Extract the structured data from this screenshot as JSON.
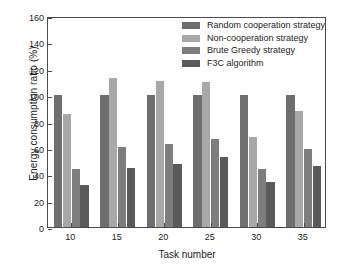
{
  "chart_data": {
    "type": "bar",
    "title": "",
    "xlabel": "Task number",
    "ylabel": "Energy consumption ratio (%)",
    "categories": [
      "10",
      "15",
      "20",
      "25",
      "30",
      "35"
    ],
    "ylim": [
      0,
      160
    ],
    "yticks": [
      0,
      20,
      40,
      60,
      80,
      100,
      120,
      140,
      160
    ],
    "grid": false,
    "legend_position": "top-right",
    "series": [
      {
        "name": "Random cooperation strategy",
        "color": "#6e6e6e",
        "values": [
          100,
          100,
          100,
          100,
          100,
          100
        ]
      },
      {
        "name": "Non-cooperation strategy",
        "color": "#a8a8a8",
        "values": [
          86,
          113,
          111,
          110,
          68,
          88
        ]
      },
      {
        "name": "Brute Greedy strategy",
        "color": "#7d7d7d",
        "values": [
          44,
          61,
          63,
          67,
          44,
          59
        ]
      },
      {
        "name": "F3C algorithm",
        "color": "#5a5a5a",
        "values": [
          32,
          45,
          48,
          53,
          34,
          46
        ]
      }
    ]
  }
}
